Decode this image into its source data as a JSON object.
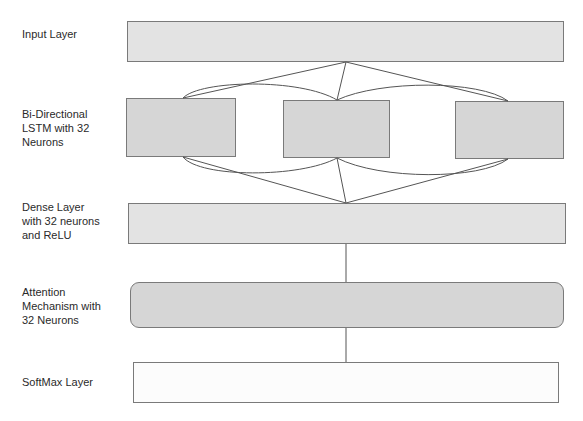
{
  "diagram": {
    "type": "neural-network-architecture",
    "layers": [
      {
        "id": "input",
        "label": "Input Layer"
      },
      {
        "id": "bilstm",
        "label": "Bi-Directional\nLSTM with 32\nNeurons",
        "units": 3
      },
      {
        "id": "dense",
        "label": "Dense Layer\nwith 32 neurons\nand ReLU"
      },
      {
        "id": "attention",
        "label": "Attention\nMechanism with\n32 Neurons"
      },
      {
        "id": "softmax",
        "label": "SoftMax Layer"
      }
    ],
    "edges": [
      {
        "from": "input",
        "to": "bilstm-1"
      },
      {
        "from": "input",
        "to": "bilstm-2"
      },
      {
        "from": "input",
        "to": "bilstm-3"
      },
      {
        "from": "bilstm-1",
        "to": "bilstm-2",
        "kind": "recurrent-curve"
      },
      {
        "from": "bilstm-2",
        "to": "bilstm-3",
        "kind": "recurrent-curve"
      },
      {
        "from": "bilstm-1",
        "to": "dense"
      },
      {
        "from": "bilstm-2",
        "to": "dense"
      },
      {
        "from": "bilstm-3",
        "to": "dense"
      },
      {
        "from": "dense",
        "to": "attention"
      },
      {
        "from": "attention",
        "to": "softmax"
      }
    ],
    "colors": {
      "box_light": "#e3e3e3",
      "box_mid": "#d6d6d6",
      "box_white": "#fcfcfc",
      "border": "#7a7a7a",
      "edge": "#555555",
      "text": "#2a2a2a"
    }
  }
}
